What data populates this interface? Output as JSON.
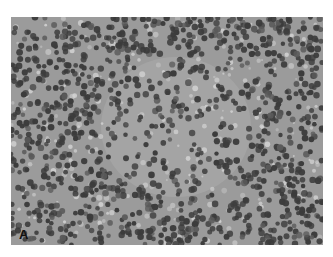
{
  "figure": {
    "type": "histology-micrograph",
    "stain": "grayscale",
    "panel_label": "A",
    "colors": {
      "background": "#9b9b9b",
      "stroma": "#a8a8a8",
      "nucleus": "#3c3c3c",
      "nucleus_light": "#5a5a5a",
      "clear_space": "#d2d2d2"
    }
  }
}
